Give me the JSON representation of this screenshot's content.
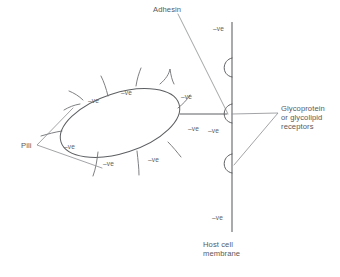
{
  "diagram": {
    "background_color": "#ffffff",
    "line_color": "#6f7174",
    "text_color": "#58595b",
    "width": 340,
    "height": 277
  },
  "labels": {
    "adhesin": "Adhesin",
    "pili": "Pili",
    "receptors": "Glycoprotein\nor glycolipid\nreceptors",
    "host_cell_membrane": "Host cell\nmembrane"
  },
  "charge_symbol": "–ve",
  "bacterium_charges": [
    {
      "id": "bact-charge-top-left",
      "text": "–ve",
      "x": 88,
      "y": 96
    },
    {
      "id": "bact-charge-top-mid",
      "text": "–ve",
      "x": 121,
      "y": 88
    },
    {
      "id": "bact-charge-top-right",
      "text": "–ve",
      "x": 181,
      "y": 92
    },
    {
      "id": "bact-charge-right",
      "text": "–ve",
      "x": 188,
      "y": 124
    },
    {
      "id": "bact-charge-left",
      "text": "–ve",
      "x": 64,
      "y": 142
    },
    {
      "id": "bact-charge-bottom-left",
      "text": "–ve",
      "x": 103,
      "y": 159
    },
    {
      "id": "bact-charge-bottom-right",
      "text": "–ve",
      "x": 148,
      "y": 155
    }
  ],
  "membrane_charges": [
    {
      "id": "membrane-charge-top",
      "text": "–ve",
      "x": 213,
      "y": 24
    },
    {
      "id": "membrane-charge-middle",
      "text": "–ve",
      "x": 208,
      "y": 126
    },
    {
      "id": "membrane-charge-bottom",
      "text": "–ve",
      "x": 212,
      "y": 213
    }
  ],
  "membrane": {
    "x": 232,
    "y_top": 22,
    "y_bottom": 232,
    "receptor_count": 3,
    "receptor_y": [
      67,
      113,
      163
    ]
  },
  "bacterium": {
    "shape": "ellipse",
    "center_x": 120,
    "center_y": 123,
    "radius_x": 62,
    "radius_y": 30,
    "rotation_deg": -18,
    "pili_count": 10
  }
}
